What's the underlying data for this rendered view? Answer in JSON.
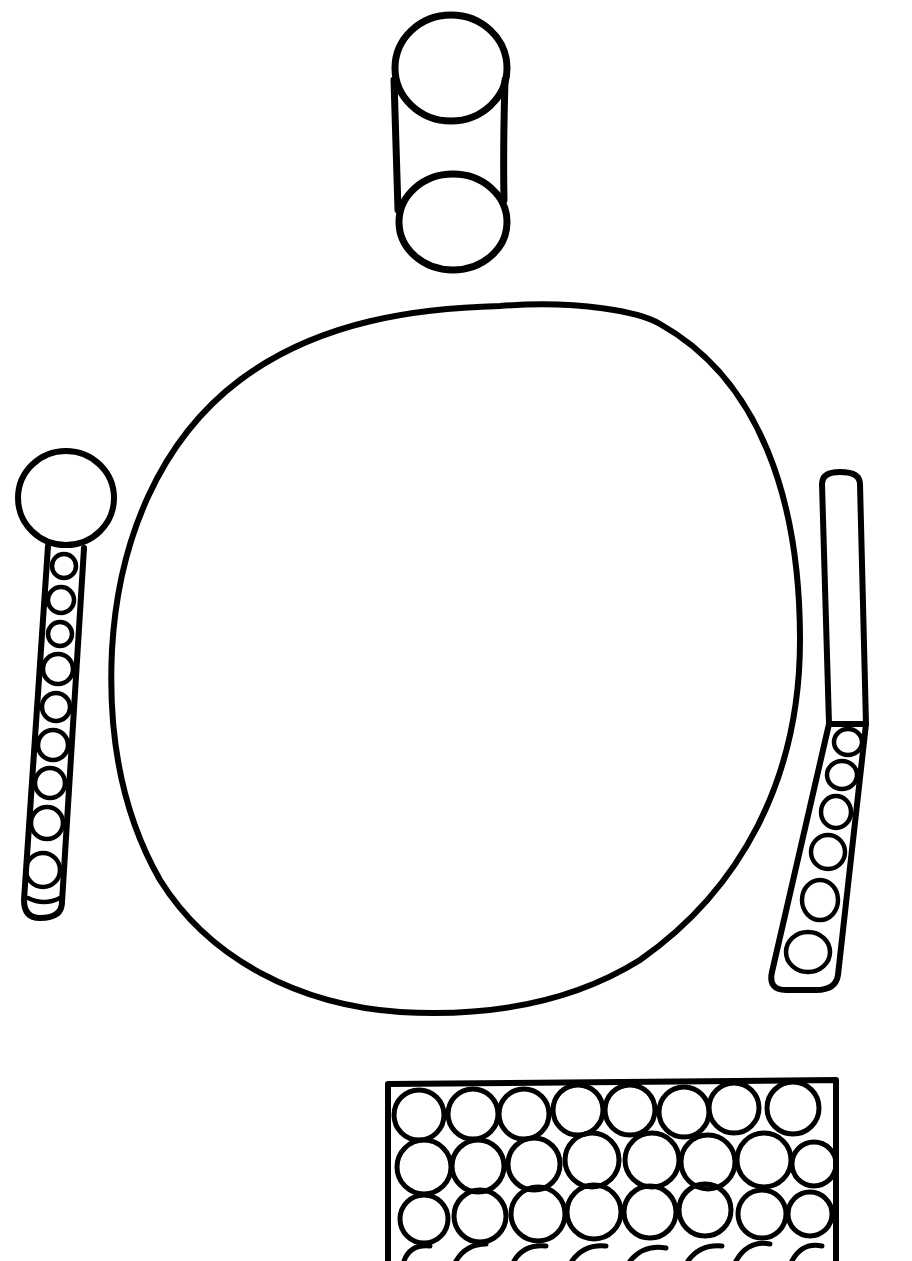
{
  "scene": {
    "title": "Table setting line drawing",
    "background_color": "#ffffff",
    "ink_color": "#000000",
    "style": "hand-drawn black outline, coloring page"
  },
  "objects": {
    "cup": {
      "label": "Cup",
      "shape": "cylinder viewed from above at an angle"
    },
    "plate": {
      "label": "Plate",
      "shape": "large irregular circle"
    },
    "spoon": {
      "label": "Spoon",
      "shape": "round head with handle filled with a vertical chain of circles",
      "handle_circle_count": 10
    },
    "knife": {
      "label": "Knife",
      "shape": "long blade with a handle filled with a chain of circles",
      "handle_circle_count": 6
    },
    "napkin": {
      "label": "Napkin",
      "shape": "rectangle filled with a grid of circles",
      "visible_rows": 4,
      "columns": 8
    }
  }
}
